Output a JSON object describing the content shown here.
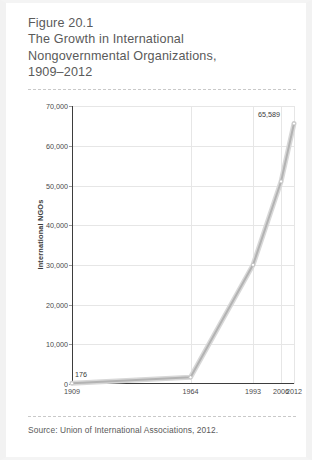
{
  "figure": {
    "number_label": "Figure 20.1",
    "title_lines": [
      "The Growth in International",
      "Nongovernmental Organizations,",
      "1909–2012"
    ],
    "source": "Source: Union of International Associations, 2012."
  },
  "chart_data": {
    "type": "line",
    "title": "The Growth in International Nongovernmental Organizations, 1909–2012",
    "xlabel": "",
    "ylabel": "International NGOs",
    "x": [
      1909,
      1964,
      1993,
      2006,
      2012
    ],
    "categories": [
      "1909",
      "1964",
      "1993",
      "2006",
      "2012"
    ],
    "values": [
      176,
      1700,
      30000,
      51000,
      65589
    ],
    "series": [
      {
        "name": "International NGOs",
        "values": [
          176,
          1700,
          30000,
          51000,
          65589
        ]
      }
    ],
    "point_labels": [
      {
        "x": "1909",
        "text": "176"
      },
      {
        "x": "2012",
        "text": "65,589"
      }
    ],
    "xtick_labels": [
      "1909",
      "1964",
      "1993",
      "2006",
      "2012"
    ],
    "ytick_labels": [
      "0",
      "10,000",
      "20,000",
      "30,000",
      "40,000",
      "50,000",
      "60,000",
      "70,000"
    ],
    "ytick_values": [
      0,
      10000,
      20000,
      30000,
      40000,
      50000,
      60000,
      70000
    ],
    "ylim": [
      0,
      70000
    ],
    "xlim": [
      1909,
      2012
    ],
    "grid": true,
    "legend": false,
    "line_color": "#b3b3b3",
    "axis_color": "#3d3d3d",
    "grid_color": "#e6e6e6"
  }
}
